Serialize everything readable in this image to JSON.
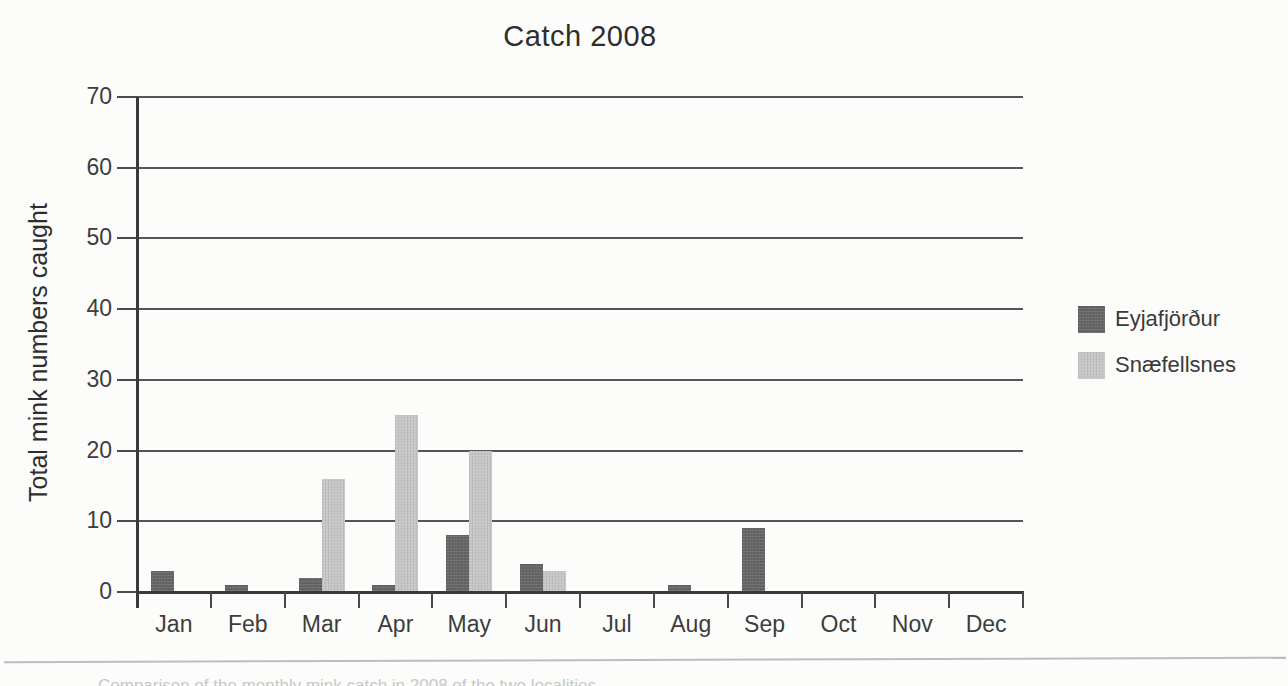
{
  "figure": {
    "background": "#fcfcfa"
  },
  "chart_data": {
    "type": "bar",
    "title": "Catch 2008",
    "xlabel": "",
    "ylabel": "Total mink numbers caught",
    "ylim": [
      0,
      70
    ],
    "yticks": [
      0,
      10,
      20,
      30,
      40,
      50,
      60,
      70
    ],
    "grid": true,
    "legend_position": "right",
    "categories": [
      "Jan",
      "Feb",
      "Mar",
      "Apr",
      "May",
      "Jun",
      "Jul",
      "Aug",
      "Sep",
      "Oct",
      "Nov",
      "Dec"
    ],
    "series": [
      {
        "id": "eyjafjordur",
        "name": "Eyjafjörður",
        "color": "#656565",
        "values": [
          3,
          1,
          2,
          1,
          8,
          4,
          0,
          1,
          9,
          0,
          0,
          0
        ]
      },
      {
        "id": "snaefellsnes",
        "name": "Snæfellsnes",
        "color": "#c6c6c6",
        "values": [
          0,
          0,
          16,
          25,
          20,
          3,
          0,
          0,
          0,
          0,
          0,
          0
        ]
      }
    ]
  },
  "footer": {
    "caption_fragment": "Comparison of the monthly mink catch in 2008 of the two localities"
  }
}
